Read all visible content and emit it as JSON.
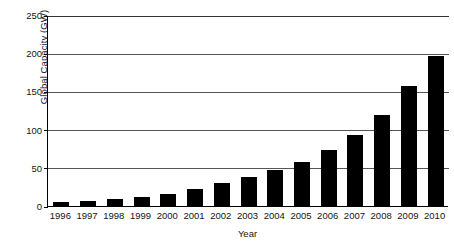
{
  "chart_data": {
    "type": "bar",
    "title": "",
    "subtitle": "",
    "xlabel": "Year",
    "ylabel": "Global Capacity (GW)",
    "categories": [
      "1996",
      "1997",
      "1998",
      "1999",
      "2000",
      "2001",
      "2002",
      "2003",
      "2004",
      "2005",
      "2006",
      "2007",
      "2008",
      "2009",
      "2010"
    ],
    "values": [
      6,
      7.5,
      10,
      13,
      17,
      24,
      31,
      39,
      48,
      59,
      74,
      94,
      121,
      159,
      198
    ],
    "series": [
      {
        "name": "Global Capacity (GW)",
        "values": [
          6,
          7.5,
          10,
          13,
          17,
          24,
          31,
          39,
          48,
          59,
          74,
          94,
          121,
          159,
          198
        ]
      }
    ],
    "ylim": [
      0,
      250
    ],
    "yticks": [
      0,
      50,
      100,
      150,
      200,
      250
    ],
    "ytick_labels": [
      "0",
      "50",
      "100",
      "150",
      "200",
      "250"
    ],
    "grid": true,
    "grid_axis": "y",
    "legend": false,
    "legend_position": "none",
    "bar_color": "#000000",
    "grid_color": "#555555",
    "axis_color": "#000000",
    "background_color": "#ffffff"
  }
}
